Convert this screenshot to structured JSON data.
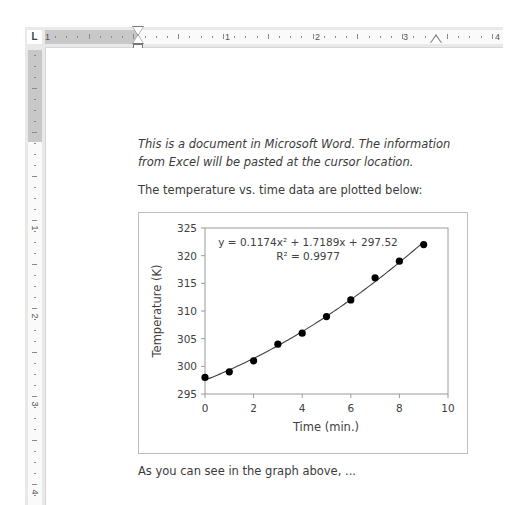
{
  "ruler_top": {
    "tab_selector": "L",
    "labels": [
      "1",
      "1",
      "2",
      "3",
      "4"
    ]
  },
  "ruler_left": {
    "labels": [
      "1",
      "2",
      "3",
      "4"
    ]
  },
  "document": {
    "para1_line1": "This is a document in Microsoft Word. The information",
    "para1_line2": "from Excel will be pasted at the cursor location.",
    "para2": "The temperature vs. time data are plotted below:",
    "para3": "As you can see in the graph above, ..."
  },
  "chart": {
    "equation": "y = 0.1174x² + 1.7189x + 297.52",
    "r_squared": "R² = 0.9977",
    "xlabel": "Time (min.)",
    "ylabel": "Temperature (K)",
    "x_ticks": [
      "0",
      "2",
      "4",
      "6",
      "8",
      "10"
    ],
    "y_ticks": [
      "325",
      "320",
      "315",
      "310",
      "305",
      "300",
      "295"
    ]
  },
  "chart_data": {
    "type": "scatter",
    "title": "",
    "xlabel": "Time (min.)",
    "ylabel": "Temperature (K)",
    "xlim": [
      0,
      10
    ],
    "ylim": [
      295,
      325
    ],
    "x_ticks": [
      0,
      2,
      4,
      6,
      8,
      10
    ],
    "y_ticks": [
      295,
      300,
      305,
      310,
      315,
      320,
      325
    ],
    "grid": false,
    "legend": "none",
    "series": [
      {
        "name": "Temperature",
        "x": [
          0,
          1,
          2,
          3,
          4,
          5,
          6,
          7,
          8,
          9
        ],
        "y": [
          298,
          299,
          301,
          304,
          306,
          309,
          312,
          316,
          319,
          322
        ],
        "marker": "circle",
        "color": "#000000"
      }
    ],
    "trendline": {
      "type": "polynomial",
      "order": 2,
      "coefficients": [
        0.1174,
        1.7189,
        297.52
      ],
      "equation": "y = 0.1174x² + 1.7189x + 297.52",
      "r_squared": 0.9977,
      "x_range": [
        0,
        9
      ],
      "color": "#404040"
    },
    "annotations": [
      "y = 0.1174x² + 1.7189x + 297.52",
      "R² = 0.9977"
    ]
  }
}
